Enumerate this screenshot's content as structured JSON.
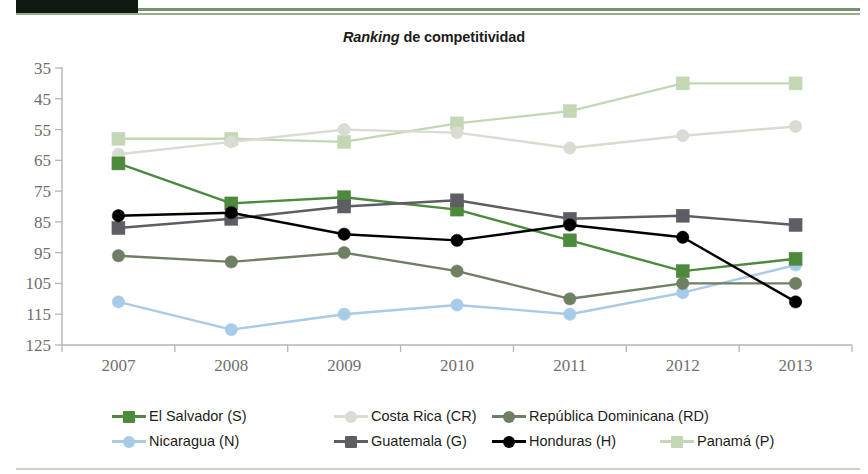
{
  "header": {
    "dark_bar_color": "#111a11",
    "rule_color": "#7a906f"
  },
  "title": {
    "italic_part": "Ranking",
    "rest_part": " de competitividad",
    "full": "Ranking de competitividad"
  },
  "axis": {
    "y_ticks": [
      "35",
      "45",
      "55",
      "65",
      "75",
      "85",
      "95",
      "105",
      "115",
      "125"
    ],
    "x_ticks": [
      "2007",
      "2008",
      "2009",
      "2010",
      "2011",
      "2012",
      "2013"
    ],
    "y_min": 35,
    "y_max": 125,
    "y_inverted": true,
    "tick_color": "#b5b5b5",
    "label_color": "#6f6f6e"
  },
  "legend": {
    "rows": [
      [
        {
          "label": "El Salvador (S)",
          "color": "#4d8a3c",
          "marker": "square",
          "x": 0
        },
        {
          "label": "Costa Rica (CR)",
          "color": "#d9dcd2",
          "marker": "circle",
          "x": 222
        },
        {
          "label": "República Dominicana (RD)",
          "color": "#6f7f63",
          "marker": "circle",
          "x": 380
        }
      ],
      [
        {
          "label": "Nicaragua (N)",
          "color": "#a8cbe8",
          "marker": "circle",
          "x": 0
        },
        {
          "label": "Guatemala (G)",
          "color": "#5d5d63",
          "marker": "square",
          "x": 222
        },
        {
          "label": "Honduras (H)",
          "color": "#000000",
          "marker": "circle",
          "x": 380
        },
        {
          "label": "Panamá (P)",
          "color": "#c3d7b5",
          "marker": "square",
          "x": 548
        }
      ]
    ]
  },
  "chart_data": {
    "type": "line",
    "title": "Ranking de competitividad",
    "xlabel": "",
    "ylabel": "",
    "x": [
      "2007",
      "2008",
      "2009",
      "2010",
      "2011",
      "2012",
      "2013"
    ],
    "ylim": [
      125,
      35
    ],
    "y_axis_inverted": true,
    "y_ticks": [
      35,
      45,
      55,
      65,
      75,
      85,
      95,
      105,
      115,
      125
    ],
    "grid": false,
    "legend_position": "bottom",
    "series": [
      {
        "name": "El Salvador (S)",
        "short": "S",
        "color": "#4d8a3c",
        "marker": "square",
        "values": [
          66,
          79,
          77,
          81,
          91,
          101,
          97
        ]
      },
      {
        "name": "Costa Rica (CR)",
        "short": "CR",
        "color": "#d9dcd2",
        "marker": "circle",
        "values": [
          63,
          59,
          55,
          56,
          61,
          57,
          54
        ]
      },
      {
        "name": "República Dominicana (RD)",
        "short": "RD",
        "color": "#6f7f63",
        "marker": "circle",
        "values": [
          96,
          98,
          95,
          101,
          110,
          105,
          105
        ]
      },
      {
        "name": "Nicaragua (N)",
        "short": "N",
        "color": "#a8cbe8",
        "marker": "circle",
        "values": [
          111,
          120,
          115,
          112,
          115,
          108,
          99
        ]
      },
      {
        "name": "Guatemala (G)",
        "short": "G",
        "color": "#5d5d63",
        "marker": "square",
        "values": [
          87,
          84,
          80,
          78,
          84,
          83,
          86
        ]
      },
      {
        "name": "Honduras (H)",
        "short": "H",
        "color": "#000000",
        "marker": "circle",
        "values": [
          83,
          82,
          89,
          91,
          86,
          90,
          111
        ]
      },
      {
        "name": "Panamá (P)",
        "short": "P",
        "color": "#c3d7b5",
        "marker": "square",
        "values": [
          58,
          58,
          59,
          53,
          49,
          40,
          40
        ]
      }
    ]
  }
}
